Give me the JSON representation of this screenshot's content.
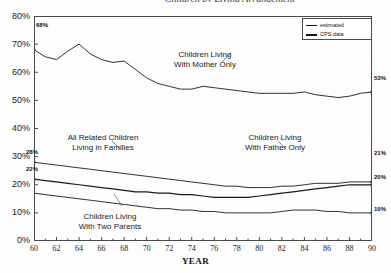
{
  "chart_data": {
    "type": "line",
    "title": "Children by Living Arrangement",
    "xlabel": "YEAR",
    "ylabel": "",
    "xlim": [
      60,
      90
    ],
    "ylim": [
      0,
      80
    ],
    "xticks": [
      "60",
      "62",
      "64",
      "66",
      "68",
      "70",
      "72",
      "74",
      "76",
      "78",
      "80",
      "82",
      "84",
      "86",
      "88",
      "90"
    ],
    "yticks": [
      "0%",
      "10%",
      "20%",
      "30%",
      "40%",
      "50%",
      "60%",
      "70%",
      "80%"
    ],
    "grid": false,
    "legend_position": "top-right",
    "legend": [
      {
        "label": "estimated",
        "style": "thin-line"
      },
      {
        "label": "CPS data",
        "style": "thick-line"
      }
    ],
    "x": [
      60,
      61,
      62,
      63,
      64,
      65,
      66,
      67,
      68,
      69,
      70,
      71,
      72,
      73,
      74,
      75,
      76,
      77,
      78,
      79,
      80,
      81,
      82,
      83,
      84,
      85,
      86,
      87,
      88,
      89,
      90
    ],
    "series": [
      {
        "name": "Children Living With Mother Only",
        "values": [
          68,
          65.5,
          64.5,
          67.5,
          70,
          66.5,
          64.5,
          63.5,
          64,
          61,
          58,
          56,
          55,
          54,
          54,
          55,
          54.5,
          54,
          53.5,
          53,
          52.5,
          52.5,
          52.5,
          52.5,
          53,
          52,
          51.5,
          51,
          51.5,
          52.5,
          53
        ],
        "start_label": "68%",
        "end_label": "53%"
      },
      {
        "name": "All Related Children Living in Families",
        "values": [
          28,
          27.5,
          27,
          26.5,
          26,
          25.5,
          25,
          24.5,
          24,
          23.5,
          23,
          22.5,
          22,
          21.5,
          21,
          20.5,
          20,
          19.5,
          19.5,
          19,
          19,
          19,
          19.5,
          19.5,
          20,
          20.5,
          20.5,
          20.5,
          21,
          21,
          21
        ],
        "start_label": "28%",
        "end_label": "21%"
      },
      {
        "name": "Children Living With Father Only",
        "values": [
          22,
          21.5,
          21,
          20.5,
          20,
          19.5,
          19,
          18.5,
          18,
          17.5,
          17.5,
          17,
          17,
          16.5,
          16.5,
          16,
          15.5,
          15.5,
          15.5,
          15.5,
          16,
          16.5,
          17,
          17.5,
          18,
          18.5,
          19,
          19.5,
          20,
          20,
          20
        ],
        "start_label": "22%",
        "end_label": "20%"
      },
      {
        "name": "Children Living With Two Parents",
        "values": [
          17,
          16.5,
          16,
          15.5,
          15,
          14.5,
          14,
          13.5,
          13,
          12.5,
          12,
          11.5,
          11.5,
          11,
          11,
          10.5,
          10.5,
          10,
          10,
          10,
          10,
          10,
          10.5,
          11,
          11,
          11,
          10.5,
          10.5,
          10,
          10,
          10
        ],
        "end_label": "10%"
      }
    ],
    "annotations": [
      {
        "text_lines": [
          "Children Living",
          "With Mother Only"
        ],
        "x": 205,
        "y": 50
      },
      {
        "text_lines": [
          "All Related Children",
          "Living in Families"
        ],
        "x": 53,
        "y": 133
      },
      {
        "text_lines": [
          "Children Living",
          "With Father Only"
        ],
        "x": 275,
        "y": 133
      },
      {
        "text_lines": [
          "Children Living",
          "With Two Parents"
        ],
        "x": 110,
        "y": 212
      }
    ]
  },
  "colors": {
    "line": "#1a1a1a",
    "axis": "#4a4a4a",
    "background": "#ffffff"
  }
}
